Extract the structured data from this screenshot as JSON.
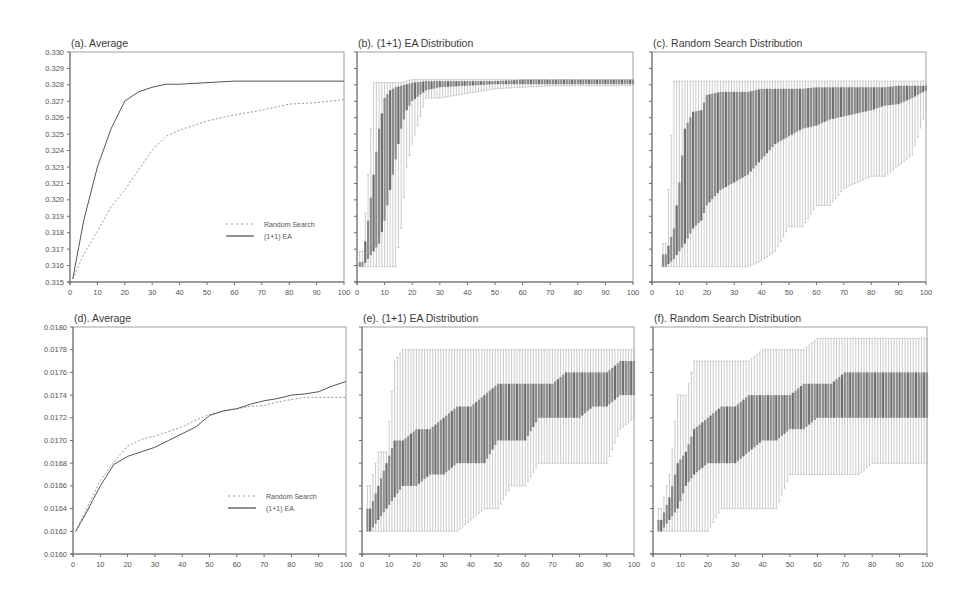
{
  "chart_data": [
    {
      "id": "a",
      "type": "line",
      "title": "(a). Average",
      "xlabel": "",
      "ylabel": "",
      "xlim": [
        0,
        100
      ],
      "ylim": [
        0.315,
        0.33
      ],
      "x_ticks": [
        "0",
        "10",
        "20",
        "30",
        "40",
        "50",
        "60",
        "70",
        "80",
        "90",
        "100"
      ],
      "y_ticks": [
        "0.330",
        "0.329",
        "0.328",
        "0.327",
        "0.326",
        "0.325",
        "0.324",
        "0.323",
        "0.321",
        "0.320",
        "0.319",
        "0.318",
        "0.317",
        "0.316",
        "0.315"
      ],
      "grid": false,
      "legend": {
        "position": "lower right",
        "entries": [
          "Random Search",
          "(1+1) EA"
        ]
      },
      "x": [
        1,
        5,
        10,
        15,
        20,
        25,
        30,
        35,
        40,
        50,
        60,
        70,
        80,
        90,
        100
      ],
      "series": [
        {
          "name": "Random Search",
          "style": "dotted",
          "values": [
            0.3152,
            0.3168,
            0.3183,
            0.3199,
            0.321,
            0.3223,
            0.3236,
            0.3245,
            0.3249,
            0.3255,
            0.3259,
            0.3262,
            0.3266,
            0.3267,
            0.3269
          ]
        },
        {
          "name": "(1+1) EA",
          "style": "solid",
          "values": [
            0.3152,
            0.319,
            0.3225,
            0.325,
            0.3268,
            0.3274,
            0.3277,
            0.3279,
            0.3279,
            0.328,
            0.3281,
            0.3281,
            0.3281,
            0.3281,
            0.3281
          ]
        }
      ]
    },
    {
      "id": "b",
      "type": "box",
      "title": "(b). (1+1) EA Distribution",
      "xlim": [
        0,
        100
      ],
      "ylim": [
        0.315,
        0.33
      ],
      "x_ticks": [
        "0",
        "10",
        "20",
        "30",
        "40",
        "50",
        "60",
        "70",
        "80",
        "90",
        "100"
      ],
      "description": "Per-generation boxplots; wide spread before generation ~20, then converges tightly near 0.328",
      "x": [
        2,
        4,
        6,
        8,
        10,
        12,
        14,
        16,
        18,
        20,
        25,
        30,
        40,
        50,
        60,
        70,
        80,
        90,
        100
      ],
      "whisker_low": [
        0.316,
        0.316,
        0.316,
        0.316,
        0.316,
        0.316,
        0.316,
        0.3185,
        0.3225,
        0.324,
        0.327,
        0.327,
        0.3273,
        0.3276,
        0.3277,
        0.3278,
        0.3278,
        0.3278,
        0.3278
      ],
      "q1": [
        0.316,
        0.3165,
        0.317,
        0.3175,
        0.319,
        0.321,
        0.323,
        0.325,
        0.3262,
        0.3268,
        0.3275,
        0.3277,
        0.3278,
        0.3279,
        0.3279,
        0.3279,
        0.3279,
        0.3279,
        0.3279
      ],
      "q3": [
        0.3163,
        0.319,
        0.322,
        0.325,
        0.327,
        0.3275,
        0.3277,
        0.3278,
        0.3279,
        0.328,
        0.3281,
        0.3281,
        0.3281,
        0.3281,
        0.3282,
        0.3282,
        0.3282,
        0.3282,
        0.3282
      ],
      "whisker_high": [
        0.317,
        0.322,
        0.328,
        0.328,
        0.328,
        0.328,
        0.328,
        0.328,
        0.3281,
        0.3282,
        0.3282,
        0.3282,
        0.3282,
        0.3282,
        0.3282,
        0.3282,
        0.3282,
        0.3282,
        0.3282
      ]
    },
    {
      "id": "c",
      "type": "box",
      "title": "(c). Random Search Distribution",
      "xlim": [
        0,
        100
      ],
      "ylim": [
        0.315,
        0.33
      ],
      "x_ticks": [
        "0",
        "10",
        "20",
        "30",
        "40",
        "50",
        "60",
        "70",
        "80",
        "90",
        "100"
      ],
      "description": "Per-generation boxplots; slow convergence, lower whiskers step upward over generations",
      "x": [
        5,
        8,
        10,
        12,
        15,
        18,
        20,
        25,
        30,
        35,
        40,
        45,
        50,
        55,
        60,
        65,
        70,
        75,
        80,
        85,
        90,
        95,
        100
      ],
      "whisker_low": [
        0.316,
        0.316,
        0.316,
        0.316,
        0.316,
        0.316,
        0.316,
        0.316,
        0.316,
        0.316,
        0.3164,
        0.317,
        0.3186,
        0.3186,
        0.32,
        0.32,
        0.3211,
        0.3215,
        0.3219,
        0.3219,
        0.3226,
        0.3233,
        0.3262
      ],
      "q1": [
        0.316,
        0.3165,
        0.317,
        0.3175,
        0.3185,
        0.319,
        0.32,
        0.321,
        0.3215,
        0.322,
        0.323,
        0.324,
        0.3245,
        0.325,
        0.3252,
        0.3256,
        0.3258,
        0.326,
        0.3262,
        0.3265,
        0.3266,
        0.327,
        0.3275
      ],
      "q3": [
        0.3168,
        0.3185,
        0.3215,
        0.325,
        0.3261,
        0.3262,
        0.3272,
        0.3274,
        0.3274,
        0.3274,
        0.3276,
        0.3276,
        0.3276,
        0.3276,
        0.3277,
        0.3277,
        0.3277,
        0.3277,
        0.3277,
        0.3277,
        0.3278,
        0.3278,
        0.3278
      ],
      "whisker_high": [
        0.3175,
        0.3281,
        0.3281,
        0.3281,
        0.3281,
        0.3281,
        0.3281,
        0.3281,
        0.3281,
        0.3281,
        0.3281,
        0.3281,
        0.3281,
        0.3281,
        0.3281,
        0.3281,
        0.3281,
        0.3281,
        0.3281,
        0.3281,
        0.3281,
        0.3281,
        0.3281
      ]
    },
    {
      "id": "d",
      "type": "line",
      "title": "(d). Average",
      "xlim": [
        0,
        100
      ],
      "ylim": [
        0.016,
        0.018
      ],
      "x_ticks": [
        "0",
        "10",
        "20",
        "30",
        "40",
        "50",
        "60",
        "70",
        "80",
        "90",
        "100"
      ],
      "y_ticks": [
        "0.0180",
        "0.0178",
        "0.0176",
        "0.0174",
        "0.0172",
        "0.0170",
        "0.0168",
        "0.0166",
        "0.0164",
        "0.0162",
        "0.0160"
      ],
      "grid": false,
      "legend": {
        "position": "lower right",
        "entries": [
          "Random Search",
          "(1+1) EA"
        ]
      },
      "x": [
        1,
        5,
        10,
        15,
        20,
        25,
        30,
        35,
        40,
        45,
        50,
        55,
        60,
        65,
        70,
        75,
        80,
        85,
        90,
        95,
        100
      ],
      "series": [
        {
          "name": "Random Search",
          "style": "dotted",
          "values": [
            0.0162,
            0.0164,
            0.01665,
            0.01681,
            0.01695,
            0.01701,
            0.01704,
            0.01708,
            0.01712,
            0.01718,
            0.01723,
            0.01726,
            0.01728,
            0.0173,
            0.01731,
            0.01734,
            0.01736,
            0.01738,
            0.01738,
            0.01738,
            0.01738
          ]
        },
        {
          "name": "(1+1) EA",
          "style": "solid",
          "values": [
            0.0162,
            0.01637,
            0.0166,
            0.01679,
            0.01686,
            0.0169,
            0.01694,
            0.017,
            0.01706,
            0.01712,
            0.01722,
            0.01726,
            0.01728,
            0.01732,
            0.01735,
            0.01737,
            0.0174,
            0.01741,
            0.01743,
            0.01748,
            0.01752
          ]
        }
      ]
    },
    {
      "id": "e",
      "type": "box",
      "title": "(e). (1+1) EA Distribution",
      "xlim": [
        0,
        100
      ],
      "ylim": [
        0.016,
        0.018
      ],
      "x_ticks": [
        "0",
        "10",
        "20",
        "30",
        "40",
        "50",
        "60",
        "70",
        "80",
        "90",
        "100"
      ],
      "x": [
        3,
        6,
        9,
        12,
        15,
        20,
        25,
        30,
        35,
        40,
        45,
        50,
        55,
        60,
        65,
        70,
        75,
        80,
        85,
        90,
        95,
        100
      ],
      "whisker_low": [
        0.0162,
        0.0162,
        0.0162,
        0.0162,
        0.0162,
        0.0162,
        0.0162,
        0.0162,
        0.0162,
        0.0163,
        0.0164,
        0.0164,
        0.0166,
        0.0166,
        0.0168,
        0.0168,
        0.0168,
        0.0168,
        0.0168,
        0.0168,
        0.0171,
        0.0172
      ],
      "q1": [
        0.0162,
        0.0163,
        0.0164,
        0.0165,
        0.0166,
        0.0166,
        0.0167,
        0.0167,
        0.0168,
        0.0168,
        0.0168,
        0.017,
        0.017,
        0.017,
        0.0172,
        0.0172,
        0.0172,
        0.0172,
        0.0173,
        0.0173,
        0.0174,
        0.0174
      ],
      "q3": [
        0.0164,
        0.0166,
        0.0168,
        0.017,
        0.017,
        0.0171,
        0.0171,
        0.0172,
        0.0173,
        0.0173,
        0.0174,
        0.0175,
        0.0175,
        0.0175,
        0.0175,
        0.0175,
        0.0176,
        0.0176,
        0.0176,
        0.0176,
        0.0177,
        0.0177
      ],
      "whisker_high": [
        0.0166,
        0.0169,
        0.0169,
        0.0177,
        0.0178,
        0.0178,
        0.0178,
        0.0178,
        0.0178,
        0.0178,
        0.0178,
        0.0178,
        0.0178,
        0.0178,
        0.0178,
        0.0178,
        0.0178,
        0.0178,
        0.0178,
        0.0178,
        0.0178,
        0.0178
      ]
    },
    {
      "id": "f",
      "type": "box",
      "title": "(f). Random Search Distribution",
      "xlim": [
        0,
        100
      ],
      "ylim": [
        0.016,
        0.018
      ],
      "x_ticks": [
        "0",
        "10",
        "20",
        "30",
        "40",
        "50",
        "60",
        "70",
        "80",
        "90",
        "100"
      ],
      "x": [
        3,
        6,
        9,
        12,
        15,
        20,
        25,
        30,
        35,
        40,
        45,
        50,
        55,
        60,
        65,
        70,
        75,
        80,
        85,
        90,
        95,
        100
      ],
      "whisker_low": [
        0.0162,
        0.0162,
        0.0162,
        0.0162,
        0.0162,
        0.0162,
        0.0164,
        0.0164,
        0.0164,
        0.0164,
        0.0164,
        0.0167,
        0.0167,
        0.0167,
        0.0167,
        0.0167,
        0.0167,
        0.0168,
        0.0168,
        0.0168,
        0.0168,
        0.0168
      ],
      "q1": [
        0.0162,
        0.0163,
        0.0164,
        0.0166,
        0.0167,
        0.0168,
        0.0168,
        0.0168,
        0.0169,
        0.017,
        0.017,
        0.0171,
        0.0171,
        0.0172,
        0.0172,
        0.0172,
        0.0172,
        0.0172,
        0.0172,
        0.0172,
        0.0172,
        0.0172
      ],
      "q3": [
        0.0163,
        0.0165,
        0.0168,
        0.0169,
        0.0171,
        0.0172,
        0.0173,
        0.0173,
        0.0174,
        0.0174,
        0.0174,
        0.0174,
        0.0175,
        0.0175,
        0.0175,
        0.0176,
        0.0176,
        0.0176,
        0.0176,
        0.0176,
        0.0176,
        0.0176
      ],
      "whisker_high": [
        0.0164,
        0.0167,
        0.0174,
        0.0174,
        0.0177,
        0.0177,
        0.0177,
        0.0177,
        0.0177,
        0.0178,
        0.0178,
        0.0178,
        0.0178,
        0.0179,
        0.0179,
        0.0179,
        0.0179,
        0.0179,
        0.0179,
        0.0179,
        0.0179,
        0.0179
      ]
    }
  ],
  "panels": [
    {
      "id": "a",
      "title": "(a). Average",
      "box": [
        70,
        52,
        344,
        282
      ],
      "y_axis": true,
      "legend": true
    },
    {
      "id": "b",
      "title": "(b). (1+1) EA Distribution",
      "box": [
        357,
        52,
        633,
        282
      ],
      "y_axis": false,
      "legend": false
    },
    {
      "id": "c",
      "title": "(c). Random Search Distribution",
      "box": [
        652,
        52,
        926,
        282
      ],
      "y_axis": false,
      "legend": false
    },
    {
      "id": "d",
      "title": "(d). Average",
      "box": [
        73,
        327,
        346,
        554
      ],
      "y_axis": true,
      "legend": true
    },
    {
      "id": "e",
      "title": "(e). (1+1) EA Distribution",
      "box": [
        362,
        327,
        634,
        554
      ],
      "y_axis": false,
      "legend": false
    },
    {
      "id": "f",
      "title": "(f). Random Search Distribution",
      "box": [
        653,
        327,
        927,
        554
      ],
      "y_axis": false,
      "legend": false
    }
  ],
  "legend_labels": {
    "random": "Random Search",
    "ea": "(1+1) EA"
  },
  "colors": {
    "axis": "#6a6a6a",
    "ea_line": "#555555",
    "random_line": "#999999",
    "box_dark": "#6e6e6e",
    "box_light": "#b5b5b5",
    "text": "#3a3a3a"
  }
}
